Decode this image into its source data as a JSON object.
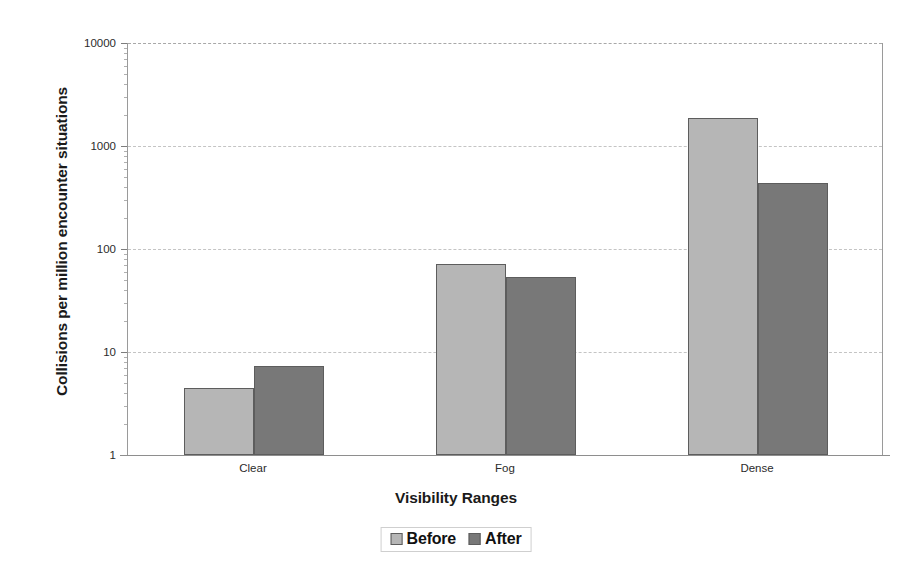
{
  "chart_data": {
    "type": "bar",
    "title": "",
    "xlabel": "Visibility Ranges",
    "ylabel": "Collisions per million encounter situations",
    "categories": [
      "Clear",
      "Fog",
      "Dense"
    ],
    "series": [
      {
        "name": "Before",
        "color": "#b6b6b6",
        "values": [
          4.5,
          72,
          1850
        ]
      },
      {
        "name": "After",
        "color": "#787878",
        "values": [
          7.3,
          53,
          440
        ]
      }
    ],
    "yscale": "log",
    "ylim": [
      1,
      10000
    ],
    "ytick_labels": [
      "10000",
      "1000",
      "100",
      "10",
      "1"
    ],
    "ytick_values": [
      10000,
      1000,
      100,
      10,
      1
    ],
    "grid": true,
    "grid_axis": "y",
    "legend_position": "bottom-center",
    "legend_entries": [
      "Before",
      "After"
    ],
    "bar_edge_color": "#5d5d5d",
    "background_color": "#ffffff"
  },
  "axes": {
    "y_title": "Collisions per million encounter situations",
    "x_title": "Visibility Ranges"
  },
  "legend": {
    "items": [
      {
        "label": "Before",
        "swatch": "legend-swatch-before"
      },
      {
        "label": "After",
        "swatch": "legend-swatch-after"
      }
    ]
  }
}
